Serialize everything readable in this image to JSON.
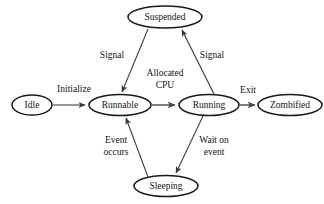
{
  "diagram": {
    "type": "state-transition-diagram",
    "title": "",
    "background_color": "#ffffff",
    "node_shape": "ellipse",
    "node_stroke_color": "#1a1a1a",
    "node_fill_color": "#ffffff",
    "edge_color": "#3a3a3a",
    "text_color": "#141414",
    "nodes": [
      {
        "id": "idle",
        "label": "Idle",
        "cx": 32,
        "cy": 105,
        "rx": 20,
        "ry": 10
      },
      {
        "id": "runnable",
        "label": "Runnable",
        "cx": 120,
        "cy": 105,
        "rx": 31,
        "ry": 10.5
      },
      {
        "id": "running",
        "label": "Running",
        "cx": 209,
        "cy": 105,
        "rx": 30,
        "ry": 10.5
      },
      {
        "id": "zombified",
        "label": "Zombified",
        "cx": 290,
        "cy": 105,
        "rx": 32,
        "ry": 10.5
      },
      {
        "id": "suspended",
        "label": "Suspended",
        "cx": 165,
        "cy": 17,
        "rx": 37,
        "ry": 11
      },
      {
        "id": "sleeping",
        "label": "Sleeping",
        "cx": 166,
        "cy": 186,
        "rx": 32,
        "ry": 10.5
      }
    ],
    "edges": [
      {
        "id": "idle-to-runnable",
        "from": "idle",
        "to": "runnable",
        "label": "Initialize",
        "label_lines": [
          "Initialize"
        ],
        "label_x": 74,
        "label_y": 90
      },
      {
        "id": "runnable-to-running",
        "from": "runnable",
        "to": "running",
        "label": "Allocated CPU",
        "label_lines": [
          "Allocated",
          "CPU"
        ],
        "label_x": 165,
        "label_y": 79
      },
      {
        "id": "running-to-zombified",
        "from": "running",
        "to": "zombified",
        "label": "Exit",
        "label_lines": [
          "Exit"
        ],
        "label_x": 247,
        "label_y": 91
      },
      {
        "id": "running-to-suspended",
        "from": "running",
        "to": "suspended",
        "label": "Signal",
        "label_lines": [
          "Signal"
        ],
        "label_x": 210,
        "label_y": 56
      },
      {
        "id": "suspended-to-runnable",
        "from": "suspended",
        "to": "runnable",
        "label": "Signal",
        "label_lines": [
          "Signal"
        ],
        "label_x": 113,
        "label_y": 56
      },
      {
        "id": "running-to-sleeping",
        "from": "running",
        "to": "sleeping",
        "label": "Wait on event",
        "label_lines": [
          "Wait on",
          "event"
        ],
        "label_x": 213,
        "label_y": 146
      },
      {
        "id": "sleeping-to-runnable",
        "from": "sleeping",
        "to": "runnable",
        "label": "Event occurs",
        "label_lines": [
          "Event",
          "occurs"
        ],
        "label_x": 116,
        "label_y": 146
      }
    ]
  }
}
